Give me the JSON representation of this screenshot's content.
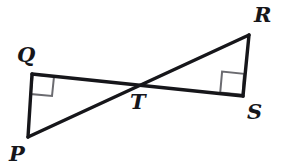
{
  "figure": {
    "background_color": "#ffffff",
    "stroke_color": "#16161a",
    "right_angle_color": "#6b6b70",
    "labels": {
      "Q": "Q",
      "P": "P",
      "R": "R",
      "S": "S",
      "T": "T"
    },
    "points": {
      "Q": {
        "x": 32,
        "y": 74
      },
      "P": {
        "x": 28,
        "y": 137
      },
      "T": {
        "x": 134,
        "y": 87
      },
      "R": {
        "x": 249,
        "y": 35
      },
      "S": {
        "x": 243,
        "y": 96
      }
    },
    "segments": [
      {
        "name": "segment-QP",
        "from": "Q",
        "to": "P"
      },
      {
        "name": "segment-QS",
        "from": "Q",
        "to": "S"
      },
      {
        "name": "segment-PR",
        "from": "P",
        "to": "R"
      },
      {
        "name": "segment-RS",
        "from": "R",
        "to": "S"
      }
    ],
    "right_angles": [
      {
        "name": "right-angle-Q",
        "at": "Q"
      },
      {
        "name": "right-angle-S",
        "at": "S"
      }
    ]
  }
}
